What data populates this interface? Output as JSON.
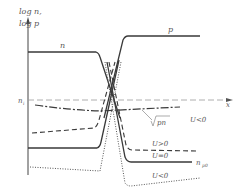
{
  "diagram": {
    "axes": {
      "y_label_line1": "log n,",
      "y_label_line2": "log p",
      "x_label": "x",
      "ni_label": "n",
      "ni_subscript": "i"
    },
    "curve_labels": {
      "n": "n",
      "p": "p",
      "sqrt_pn": "pn",
      "u_neg_top": "U<0",
      "u_pos": "U>0",
      "u_zero": "U=0",
      "u_neg_bottom": "U<0",
      "np0": "n",
      "np0_subscript": "p0"
    }
  }
}
